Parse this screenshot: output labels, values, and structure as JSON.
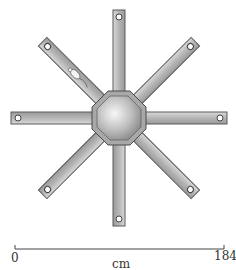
{
  "diagram": {
    "center": [
      119,
      118
    ],
    "arm_count": 8,
    "arm_angles_deg": [
      -90,
      -45,
      0,
      45,
      90,
      135,
      180,
      225
    ],
    "subject_arm_deg": 225
  },
  "scale_bar": {
    "start_label": "0",
    "end_label": "184",
    "unit_label": "cm"
  },
  "colors": {
    "arm_fill": "#bdbdbd",
    "arm_edge": "#5a5a5a",
    "hub_light": "#f2f2f2",
    "hub_dark": "#8a8a8a",
    "scale_line": "#444444"
  }
}
